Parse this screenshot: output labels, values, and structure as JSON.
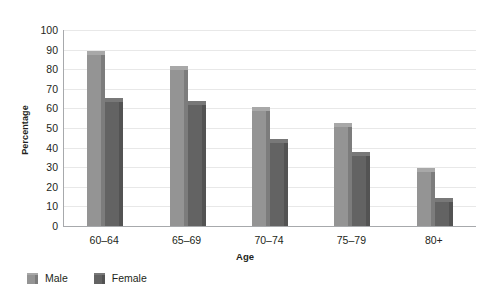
{
  "chart_data": {
    "type": "bar",
    "title": "",
    "xlabel": "Age",
    "ylabel": "Percentage",
    "categories": [
      "60–64",
      "65–69",
      "70–74",
      "75–79",
      "80+"
    ],
    "series": [
      {
        "name": "Male",
        "values": [
          88,
          80,
          59,
          51,
          28
        ],
        "color": "#949494"
      },
      {
        "name": "Female",
        "values": [
          64,
          62,
          43,
          36,
          13
        ],
        "color": "#636363"
      }
    ],
    "ylim": [
      0,
      100
    ],
    "ytick_labels": [
      "0",
      "10",
      "20",
      "30",
      "40",
      "50",
      "60",
      "70",
      "80",
      "90",
      "100"
    ],
    "ytick_values": [
      0,
      10,
      20,
      30,
      40,
      50,
      60,
      70,
      80,
      90,
      100
    ],
    "grid": true,
    "legend_position": "bottom-left",
    "legend": [
      "Male",
      "Female"
    ]
  }
}
